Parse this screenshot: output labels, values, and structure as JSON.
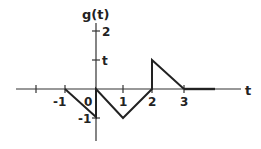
{
  "diagram": {
    "y_axis_label": "g(t)",
    "x_axis_label": "t",
    "x_ticks": [
      {
        "label": "",
        "value": -2
      },
      {
        "label": "-1",
        "value": -1
      },
      {
        "label": "0",
        "value": 0
      },
      {
        "label": "1",
        "value": 1
      },
      {
        "label": "2",
        "value": 2
      },
      {
        "label": "3",
        "value": 3
      }
    ],
    "y_ticks": [
      {
        "label": "2",
        "value": 2
      },
      {
        "label": "t",
        "value": 1
      },
      {
        "label": "-1",
        "value": -1
      }
    ],
    "segments": [
      {
        "from": [
          -1,
          0
        ],
        "to": [
          0,
          -1
        ]
      },
      {
        "from": [
          0,
          -1
        ],
        "to": [
          0,
          0
        ]
      },
      {
        "from": [
          0,
          0
        ],
        "to": [
          1,
          -1
        ]
      },
      {
        "from": [
          1,
          -1
        ],
        "to": [
          2,
          0
        ]
      },
      {
        "from": [
          2,
          0
        ],
        "to": [
          2,
          1
        ]
      },
      {
        "from": [
          2,
          1
        ],
        "to": [
          3,
          0
        ]
      },
      {
        "from": [
          3,
          0
        ],
        "to": [
          4,
          0
        ]
      }
    ],
    "line_color": "#222222"
  }
}
